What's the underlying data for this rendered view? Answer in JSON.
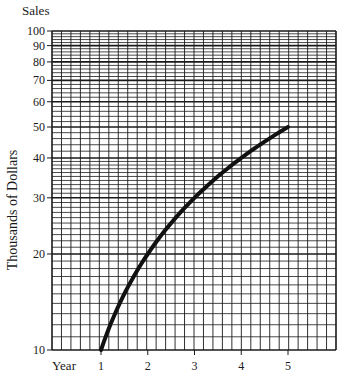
{
  "chart_data": {
    "type": "line",
    "title": "Sales",
    "xlabel": "Year",
    "ylabel": "Thousands of Dollars",
    "yscale": "log",
    "ylim": [
      10,
      100
    ],
    "xlim": [
      0,
      6
    ],
    "grid": true,
    "x_ticks": [
      1,
      2,
      3,
      4,
      5
    ],
    "y_ticks": [
      10,
      20,
      30,
      40,
      50,
      60,
      70,
      80,
      90,
      100
    ],
    "series": [
      {
        "name": "Sales",
        "x": [
          1,
          2,
          3,
          4,
          5
        ],
        "values": [
          10,
          20,
          30,
          40,
          50
        ]
      }
    ]
  },
  "labels": {
    "title": "Sales",
    "xlabel": "Year",
    "ylabel": "Thousands of Dollars"
  }
}
